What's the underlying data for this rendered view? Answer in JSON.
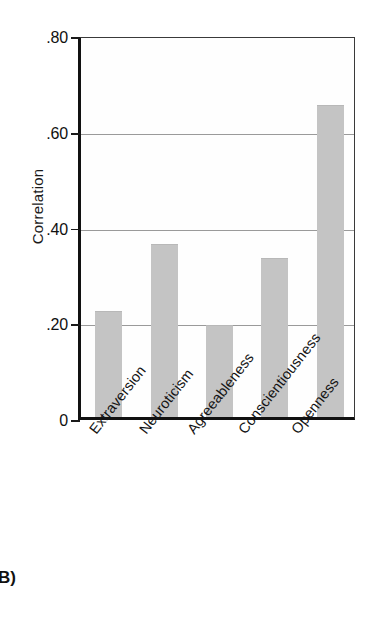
{
  "panel": {
    "letter": "B)"
  },
  "chart_data": {
    "type": "bar",
    "title": "",
    "subtitle": "",
    "xlabel": "",
    "ylabel": "Correlation",
    "categories": [
      "Extraversion",
      "Neuroticism",
      "Agreeableness",
      "Conscientiousness",
      "Openness"
    ],
    "values": [
      0.22,
      0.36,
      0.19,
      0.33,
      0.65
    ],
    "ylim": [
      0,
      0.8
    ],
    "ytick_values": [
      0,
      0.2,
      0.4,
      0.6,
      0.8
    ],
    "ytick_labels": [
      "0",
      ".20",
      ".40",
      ".60",
      ".80"
    ],
    "grid": true,
    "grid_axis": "y",
    "legend": false,
    "legend_position": "none",
    "bar_color": "#c4c4c4",
    "axis_color": "#111111",
    "gridline_color": "#9a9a9a"
  }
}
